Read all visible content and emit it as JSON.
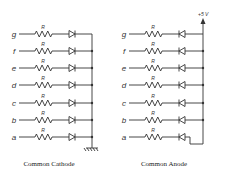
{
  "diagram": {
    "left": {
      "caption": "Common Cathode",
      "segments": [
        "g",
        "f",
        "e",
        "d",
        "c",
        "b",
        "a"
      ],
      "resistor_label": "R",
      "terminal": "ground"
    },
    "right": {
      "caption": "Common Anode",
      "segments": [
        "g",
        "f",
        "e",
        "d",
        "c",
        "b",
        "a"
      ],
      "resistor_label": "R",
      "supply_label": "+5 V"
    }
  }
}
